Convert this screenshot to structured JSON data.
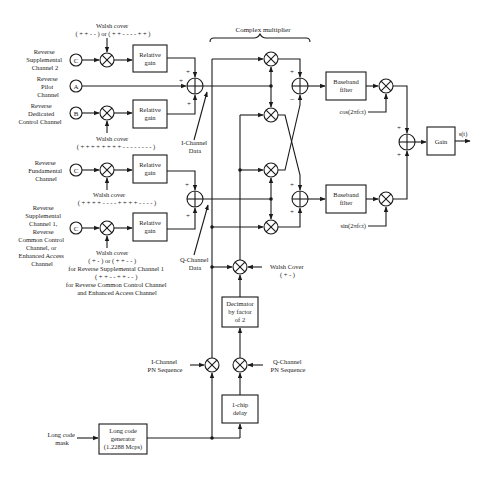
{
  "diagram": {
    "title": "Complex multiplier",
    "inputs": {
      "supp2": {
        "letter": "C",
        "label": [
          "Reverse",
          "Supplemental",
          "Channel 2"
        ]
      },
      "pilot": {
        "letter": "A",
        "label": [
          "Reverse",
          "Pilot",
          "Channel"
        ]
      },
      "dedicated": {
        "letter": "B",
        "label": [
          "Reverse",
          "Dedicated",
          "Control Channel"
        ]
      },
      "fundamental": {
        "letter": "C",
        "label": [
          "Reverse",
          "Fundamental",
          "Channel"
        ]
      },
      "supp1": {
        "letter": "C",
        "label": [
          "Reverse",
          "Supplemental",
          "Channel 1,",
          "Reverse",
          "Common Control",
          "Channel, or",
          "Enhanced Access",
          "Channel"
        ]
      }
    },
    "walsh": {
      "supp2": [
        "Walsh cover",
        "( + + - - )  or ( + + - - - - + + )"
      ],
      "dedicated": [
        "Walsh cover",
        "( + + + + + + + + - - - - - - - - )"
      ],
      "fundamental": [
        "Walsh cover",
        "( + + + + - - - - + + + + - - - - )"
      ],
      "supp1": [
        "Walsh cover",
        "( + - )  or ( + + - - )",
        "for Reverse Supplemental Channel 1",
        "( + + - - + + - - )",
        "for Reverse Common Control Channel",
        "and Enhanced Access Channel"
      ],
      "q_cover": [
        "Walsh Cover",
        "( + - )"
      ]
    },
    "blocks": {
      "relative_gain": [
        "Relative",
        "gain"
      ],
      "baseband_filter": [
        "Baseband",
        "filter"
      ],
      "gain": "Gain",
      "decimator": [
        "Decimator",
        "by factor",
        "of 2"
      ],
      "chip_delay": [
        "1-chip",
        "delay"
      ],
      "long_code_gen": [
        "Long code",
        "generator",
        "(1.2288 Mcps)"
      ]
    },
    "signals": {
      "i_data": [
        "I-Channel",
        "Data"
      ],
      "q_data": [
        "Q-Channel",
        "Data"
      ],
      "i_pn": [
        "I-Channel",
        "PN Sequence"
      ],
      "q_pn": [
        "Q-Channel",
        "PN Sequence"
      ],
      "long_code_mask": [
        "Long code",
        "mask"
      ],
      "cos": "cos(2πfᴄt)",
      "sin": "sin(2πfᴄt)",
      "output": "s(t)"
    },
    "signs": {
      "plus": "+",
      "minus": "−"
    }
  }
}
